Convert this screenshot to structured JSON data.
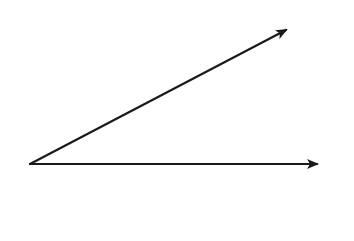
{
  "diagram": {
    "type": "angle",
    "stroke_color": "#1a1a1a",
    "background_color": "#ffffff",
    "vertex": {
      "x": 30,
      "y": 164
    },
    "rays": [
      {
        "name": "upper-ray",
        "end": {
          "x": 286,
          "y": 30
        }
      },
      {
        "name": "lower-ray",
        "end": {
          "x": 317,
          "y": 164
        }
      }
    ]
  }
}
